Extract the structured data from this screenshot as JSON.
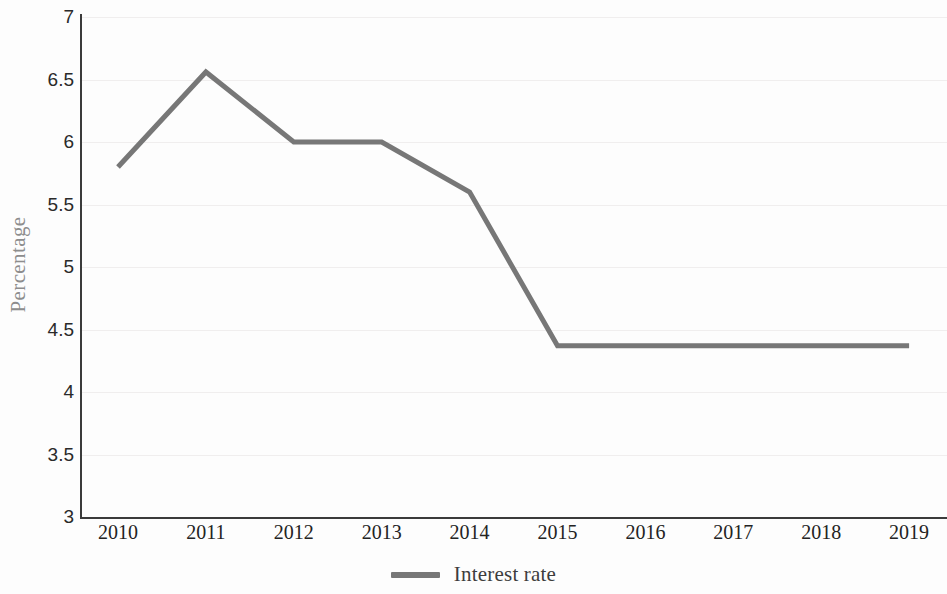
{
  "chart_data": {
    "type": "line",
    "title": "",
    "xlabel": "",
    "ylabel": "Percentage",
    "categories": [
      "2010",
      "2011",
      "2012",
      "2013",
      "2014",
      "2015",
      "2016",
      "2017",
      "2018",
      "2019"
    ],
    "series": [
      {
        "name": "Interest rate",
        "values": [
          5.8,
          6.56,
          6.0,
          6.0,
          5.6,
          4.37,
          4.37,
          4.37,
          4.37,
          4.37
        ],
        "color": "#777777"
      }
    ],
    "ylim": [
      3,
      7
    ],
    "ytick_values": [
      7,
      6.5,
      6,
      5.5,
      5,
      4.5,
      4,
      3.5,
      3
    ],
    "ytick_labels": [
      "7",
      "6.5",
      "6",
      "5.5",
      "5",
      "4.5",
      "4",
      "3.5",
      "3"
    ],
    "grid": true,
    "grid_axis": "y",
    "legend_position": "bottom",
    "line_width": 5,
    "axis_color": "#3b3b3b",
    "grid_color": "#f0eeee",
    "background_color": "#ffffff"
  },
  "legend": {
    "entries": [
      {
        "label": "Interest rate",
        "color": "#777777"
      }
    ]
  }
}
